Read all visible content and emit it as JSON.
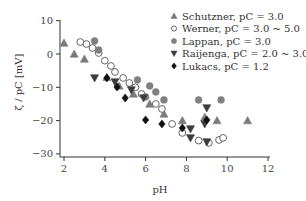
{
  "chart_data": {
    "type": "scatter",
    "title": "",
    "xlabel": "pH",
    "ylabel": "ζ / pC [mV]",
    "xlim": [
      1.8,
      12.2
    ],
    "ylim": [
      -31,
      12
    ],
    "xticks": [
      2,
      4,
      6,
      8,
      10,
      12
    ],
    "yticks": [
      10,
      0,
      -10,
      -20,
      -30
    ],
    "grid": false,
    "legend_position": "upper right",
    "series": [
      {
        "name": "Schutzner, pC = 3.0",
        "marker": "triangle-up",
        "color": "#7a7a7a",
        "filled": true,
        "points": [
          [
            2.0,
            3.3
          ],
          [
            2.5,
            0
          ],
          [
            3.0,
            -1.5
          ],
          [
            4.1,
            -7
          ],
          [
            4.7,
            -9.6
          ],
          [
            5.4,
            -12
          ],
          [
            6.2,
            -15
          ],
          [
            6.9,
            -18
          ],
          [
            7.8,
            -20
          ],
          [
            8.9,
            -19
          ],
          [
            9.5,
            -20
          ],
          [
            11.0,
            -20
          ]
        ]
      },
      {
        "name": "Werner, pC = 3.0 ~ 5.0",
        "marker": "circle",
        "color": "#555555",
        "filled": false,
        "points": [
          [
            2.8,
            3.6
          ],
          [
            3.1,
            3
          ],
          [
            3.4,
            1.8
          ],
          [
            3.7,
            0.3
          ],
          [
            4.0,
            -2
          ],
          [
            4.3,
            -3.6
          ],
          [
            4.5,
            -5.4
          ],
          [
            4.9,
            -7.2
          ],
          [
            5.2,
            -8.7
          ],
          [
            5.5,
            -10
          ],
          [
            5.8,
            -12
          ],
          [
            6.5,
            -15
          ],
          [
            6.8,
            -16.5
          ],
          [
            7.3,
            -21
          ],
          [
            7.8,
            -23.7
          ],
          [
            8.6,
            -26
          ],
          [
            9.1,
            -26.7
          ],
          [
            9.6,
            -25.8
          ],
          [
            9.8,
            -25.2
          ]
        ]
      },
      {
        "name": "Lappan, pC = 3.0",
        "marker": "circle",
        "color": "#808080",
        "filled": true,
        "points": [
          [
            3.5,
            3.9
          ],
          [
            3.7,
            1.2
          ],
          [
            5.6,
            -7.8
          ],
          [
            6.0,
            -12.9
          ],
          [
            6.2,
            -9.6
          ],
          [
            6.5,
            -11.4
          ],
          [
            6.9,
            -13.8
          ],
          [
            8.6,
            -13.8
          ],
          [
            9.7,
            -13.8
          ]
        ]
      },
      {
        "name": "Raijenga, pC = 2.0 ~ 3.0",
        "marker": "triangle-down",
        "color": "#3c3c3c",
        "filled": true,
        "points": [
          [
            3.5,
            -7.2
          ],
          [
            4.5,
            -8.4
          ],
          [
            5.3,
            -10.8
          ],
          [
            5.9,
            -13.2
          ],
          [
            8.2,
            -22.5
          ],
          [
            8.2,
            -25.2
          ],
          [
            8.9,
            -21
          ],
          [
            9.0,
            -16.2
          ],
          [
            9.0,
            -26.4
          ]
        ]
      },
      {
        "name": "Lukacs, pC = 1.2",
        "marker": "diamond",
        "color": "#111111",
        "filled": true,
        "points": [
          [
            4.1,
            -7.2
          ],
          [
            4.6,
            -9.9
          ],
          [
            5.0,
            -13.2
          ],
          [
            6.0,
            -19.8
          ],
          [
            6.8,
            -21
          ],
          [
            7.8,
            -22.2
          ],
          [
            9.0,
            -19.8
          ]
        ]
      }
    ]
  },
  "layout": {
    "plot": {
      "x0": 60,
      "y0": 157,
      "x_origin_px": 64,
      "px_per_x": 20.4,
      "y_zero_px": 54,
      "px_per_y": 3.33,
      "x_end": 270,
      "y_top": 20
    }
  }
}
